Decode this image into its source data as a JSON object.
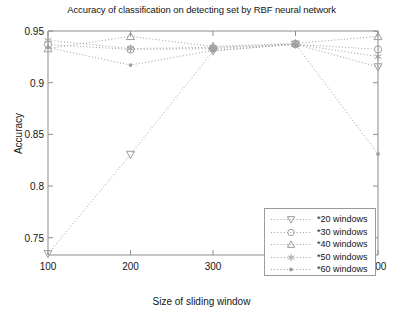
{
  "chart_data": {
    "type": "line",
    "title": "Accuracy of classification on detecting set by RBF neural network",
    "xlabel": "Size of sliding window",
    "ylabel": "Accuracy",
    "x": [
      100,
      200,
      300,
      400,
      500
    ],
    "xtick_labels": [
      "100",
      "200",
      "300",
      "400",
      "500"
    ],
    "ytick_labels": [
      "0.75",
      "0.8",
      "0.85",
      "0.9",
      "0.95"
    ],
    "yticks": [
      0.75,
      0.8,
      0.85,
      0.9,
      0.95
    ],
    "xlim": [
      100,
      500
    ],
    "ylim": [
      0.7333,
      0.95
    ],
    "grid": false,
    "legend_position": "lower right",
    "line_style": "dotted",
    "series": [
      {
        "name": "*20 windows",
        "marker": "triangle-down",
        "values": [
          0.7345,
          0.8305,
          0.9305,
          0.9372,
          0.9152
        ]
      },
      {
        "name": "*30 windows",
        "marker": "circle",
        "values": [
          0.9368,
          0.9322,
          0.933,
          0.9372,
          0.9322
        ]
      },
      {
        "name": "*40 windows",
        "marker": "triangle-up",
        "values": [
          0.933,
          0.9448,
          0.935,
          0.938,
          0.9448
        ]
      },
      {
        "name": "*50 windows",
        "marker": "asterisk",
        "values": [
          0.941,
          0.933,
          0.9342,
          0.9372,
          0.9252
        ]
      },
      {
        "name": "*60 windows",
        "marker": "dot",
        "values": [
          0.934,
          0.917,
          0.9312,
          0.9372,
          0.831
        ]
      }
    ]
  },
  "legend": {
    "items": [
      {
        "label": "*20 windows",
        "marker": "triangle-down"
      },
      {
        "label": "*30 windows",
        "marker": "circle"
      },
      {
        "label": "*40 windows",
        "marker": "triangle-up"
      },
      {
        "label": "*50 windows",
        "marker": "asterisk"
      },
      {
        "label": "*60 windows",
        "marker": "dot"
      }
    ]
  },
  "colors": {
    "axis": "#8c8c8c",
    "text": "#141414",
    "series": "#9e9e9e",
    "legend_border": "#9a9a9a",
    "background": "#ffffff"
  }
}
